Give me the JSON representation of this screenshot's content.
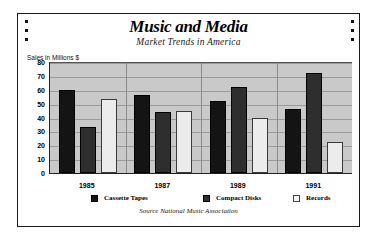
{
  "chart_data": {
    "type": "bar",
    "title": "Music and Media",
    "subtitle": "Market Trends in America",
    "xlabel": "",
    "ylabel": "Sales in Millions $",
    "ylim": [
      0,
      80
    ],
    "yticks": [
      80,
      70,
      60,
      50,
      40,
      30,
      20,
      10,
      0
    ],
    "grid": true,
    "legend_position": "bottom",
    "categories": [
      "1985",
      "1987",
      "1989",
      "1991"
    ],
    "series": [
      {
        "name": "Cassette Tapes",
        "color": "#141414",
        "values": [
          60,
          56,
          52,
          46
        ]
      },
      {
        "name": "Compact Disks",
        "color": "#2e2e2e",
        "values": [
          33,
          44,
          62,
          72
        ]
      },
      {
        "name": "Records",
        "color": "#ececec",
        "values": [
          53,
          45,
          40,
          22
        ]
      }
    ],
    "source_note": "Source National Music Association"
  },
  "decor": {
    "left_dots": 3,
    "right_dots": 3
  }
}
